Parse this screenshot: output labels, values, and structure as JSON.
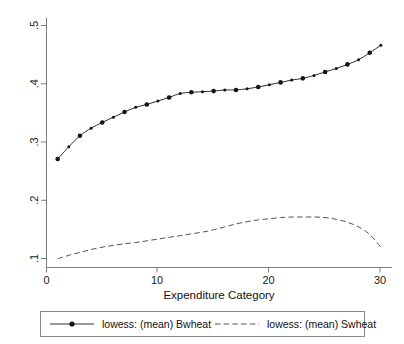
{
  "chart_data": {
    "type": "line",
    "title": "",
    "subtitle": "",
    "xlabel": "Expenditure Category",
    "ylabel": "",
    "xlim": [
      0,
      31
    ],
    "ylim": [
      0.085,
      0.515
    ],
    "xticks": [
      0,
      10,
      20,
      30
    ],
    "xticklabels": [
      "0",
      "10",
      "20",
      "30"
    ],
    "yticks": [
      0.1,
      0.2,
      0.3,
      0.4,
      0.5
    ],
    "yticklabels": [
      ".1",
      ".2",
      ".3",
      ".4",
      ".5"
    ],
    "grid": false,
    "legend_position": "bottom",
    "x": [
      1,
      2,
      3,
      4,
      5,
      6,
      7,
      8,
      9,
      10,
      11,
      12,
      13,
      14,
      15,
      16,
      17,
      18,
      19,
      20,
      21,
      22,
      23,
      24,
      25,
      26,
      27,
      28,
      29,
      30
    ],
    "series": [
      {
        "name": "lowess: (mean) Bwheat",
        "style": "solid",
        "markers": true,
        "values": [
          0.272,
          0.293,
          0.312,
          0.325,
          0.335,
          0.344,
          0.353,
          0.361,
          0.366,
          0.372,
          0.378,
          0.385,
          0.387,
          0.388,
          0.389,
          0.391,
          0.391,
          0.393,
          0.396,
          0.4,
          0.404,
          0.408,
          0.411,
          0.416,
          0.422,
          0.428,
          0.435,
          0.443,
          0.455,
          0.468
        ]
      },
      {
        "name": "lowess: (mean) Swheat",
        "style": "dashed",
        "markers": false,
        "values": [
          0.1,
          0.106,
          0.111,
          0.116,
          0.12,
          0.123,
          0.126,
          0.128,
          0.131,
          0.134,
          0.137,
          0.14,
          0.143,
          0.146,
          0.15,
          0.155,
          0.16,
          0.164,
          0.167,
          0.169,
          0.171,
          0.172,
          0.172,
          0.172,
          0.171,
          0.168,
          0.163,
          0.155,
          0.142,
          0.12
        ]
      }
    ]
  },
  "legend": {
    "entries": [
      {
        "label": "lowess: (mean) Bwheat",
        "style": "solid",
        "marker": true
      },
      {
        "label": "lowess: (mean) Swheat",
        "style": "dashed",
        "marker": false
      }
    ]
  },
  "axes": {
    "x_title": "Expenditure Category",
    "x_tick_labels": [
      "0",
      "10",
      "20",
      "30"
    ],
    "y_tick_labels": [
      ".1",
      ".2",
      ".3",
      ".4",
      ".5"
    ]
  },
  "colors": {
    "background": "#ffffff",
    "axis": "#6d6d6d",
    "series_solid": "#1b1b1b",
    "series_dashed": "#4a4a4a",
    "text": "#111111",
    "legend_border": "#7a7a7a"
  }
}
